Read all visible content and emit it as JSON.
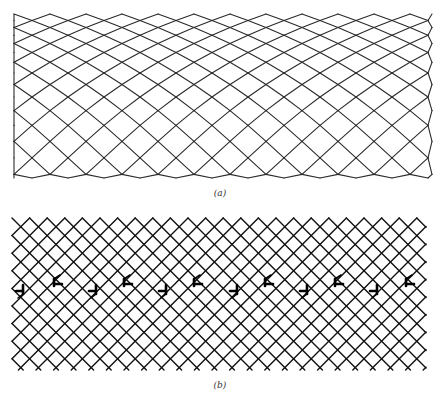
{
  "figure": {
    "panels": [
      {
        "id": "a",
        "caption": "(a)",
        "description": "Square lattice network viewed at 45°, with cells compressed near top and smoothly bent/expanded toward bottom (elastic bending, no defects)",
        "line_color": "#2a2a2a"
      },
      {
        "id": "b",
        "caption": "(b)",
        "description": "Square lattice network at 45° containing a horizontal row of edge dislocations forming a tilt boundary",
        "line_color": "#111111",
        "dislocation_color": "#000000",
        "dislocations": [
          {
            "x": 20,
            "y": 290,
            "orientation": "lower"
          },
          {
            "x": 58,
            "y": 282,
            "orientation": "upper"
          },
          {
            "x": 93,
            "y": 290,
            "orientation": "lower"
          },
          {
            "x": 128,
            "y": 282,
            "orientation": "upper"
          },
          {
            "x": 163,
            "y": 290,
            "orientation": "lower"
          },
          {
            "x": 198,
            "y": 282,
            "orientation": "upper"
          },
          {
            "x": 234,
            "y": 290,
            "orientation": "lower"
          },
          {
            "x": 269,
            "y": 282,
            "orientation": "upper"
          },
          {
            "x": 304,
            "y": 290,
            "orientation": "lower"
          },
          {
            "x": 339,
            "y": 282,
            "orientation": "upper"
          },
          {
            "x": 374,
            "y": 290,
            "orientation": "lower"
          },
          {
            "x": 410,
            "y": 282,
            "orientation": "upper"
          }
        ]
      }
    ]
  }
}
